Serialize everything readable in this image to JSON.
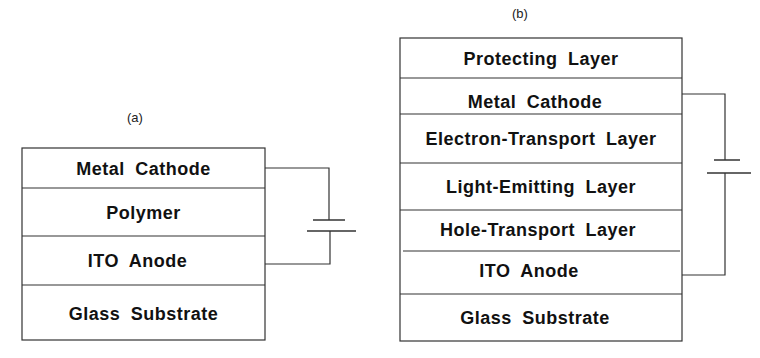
{
  "diagram_a": {
    "caption": "(a)",
    "layers": [
      {
        "label": "Metal  Cathode"
      },
      {
        "label": "Polymer"
      },
      {
        "label": "ITO   Anode"
      },
      {
        "label": "Glass  Substrate"
      }
    ],
    "circuit": {
      "source": "battery-icon",
      "connects": [
        "Metal Cathode",
        "ITO Anode"
      ]
    }
  },
  "diagram_b": {
    "caption": "(b)",
    "layers": [
      {
        "label": "Protecting  Layer"
      },
      {
        "label": "Metal  Cathode"
      },
      {
        "label": "Electron-Transport  Layer"
      },
      {
        "label": "Light-Emitting   Layer"
      },
      {
        "label": "Hole-Transport  Layer"
      },
      {
        "label": "ITO   Anode"
      },
      {
        "label": "Glass  Substrate"
      }
    ],
    "circuit": {
      "source": "battery-icon",
      "connects": [
        "Metal Cathode",
        "ITO Anode"
      ]
    }
  },
  "colors": {
    "line": "#333333",
    "text": "#111111",
    "background": "#ffffff"
  }
}
